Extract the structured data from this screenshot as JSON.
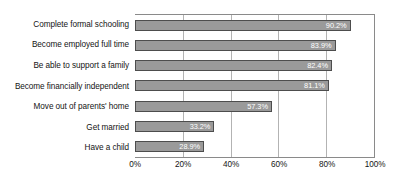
{
  "chart_data": {
    "type": "bar",
    "orientation": "horizontal",
    "title": "",
    "xlabel": "",
    "ylabel": "",
    "xlim": [
      0,
      100
    ],
    "grid": true,
    "legend": false,
    "categories": [
      "Complete formal schooling",
      "Become employed full time",
      "Be able to support a family",
      "Become financially independent",
      "Move out of parents' home",
      "Get married",
      "Have a child"
    ],
    "values": [
      90.2,
      83.9,
      82.4,
      81.1,
      57.3,
      33.2,
      28.9
    ],
    "value_labels": [
      "90.2%",
      "83.9%",
      "82.4%",
      "81.1%",
      "57.3%",
      "33.2%",
      "28.9%"
    ],
    "xticks": [
      0,
      20,
      40,
      60,
      80,
      100
    ],
    "xtick_labels": [
      "0%",
      "20%",
      "40%",
      "60%",
      "80%",
      "100%"
    ],
    "colors": {
      "bar_fill": "#9a9a9a",
      "bar_border": "#4d4d4d",
      "value_label": "#ffffff",
      "gridline": "#b3b3b3",
      "axis_border": "#8a8a8a",
      "text": "#141414",
      "background": "#ffffff"
    }
  }
}
